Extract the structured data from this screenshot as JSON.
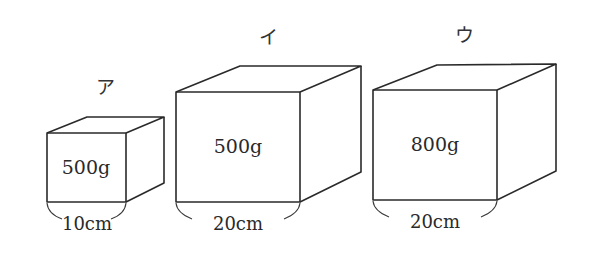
{
  "figure": {
    "boxes": [
      {
        "label": "ア",
        "weight": "500g",
        "edge_length": "10cm"
      },
      {
        "label": "イ",
        "weight": "500g",
        "edge_length": "20cm"
      },
      {
        "label": "ウ",
        "weight": "800g",
        "edge_length": "20cm"
      }
    ]
  }
}
